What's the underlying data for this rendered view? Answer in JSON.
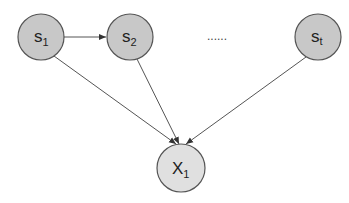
{
  "diagram": {
    "nodes": [
      {
        "id": "s1",
        "label": "s",
        "sub": "1",
        "cx": 41,
        "cy": 37,
        "r": 23,
        "fill": "#c8c8c8"
      },
      {
        "id": "s2",
        "label": "s",
        "sub": "2",
        "cx": 130,
        "cy": 37,
        "r": 23,
        "fill": "#c8c8c8"
      },
      {
        "id": "st",
        "label": "s",
        "sub": "t",
        "cx": 318,
        "cy": 37,
        "r": 23,
        "fill": "#c8c8c8"
      },
      {
        "id": "x1",
        "label": "X",
        "sub": "1",
        "cx": 181,
        "cy": 168,
        "r": 24,
        "fill": "#e0e0e0"
      }
    ],
    "ellipsis": "......",
    "edges": [
      {
        "from": "s1",
        "to": "s2"
      },
      {
        "from": "s1",
        "to": "x1"
      },
      {
        "from": "s2",
        "to": "x1"
      },
      {
        "from": "st",
        "to": "x1"
      }
    ],
    "stroke": "#555555"
  }
}
